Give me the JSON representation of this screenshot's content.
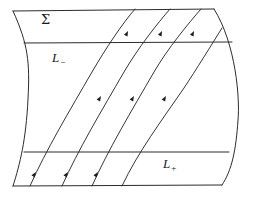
{
  "figure": {
    "kind": "flow-box-diagram",
    "background_color": "#ffffff",
    "stroke_color": "#2b2b2b",
    "label_color": "#1a1a1a"
  },
  "labels": {
    "sigma": {
      "text": "Σ",
      "x": 41,
      "y": 24
    },
    "l_minus": {
      "base": "L",
      "sub": "−",
      "x": 52,
      "y": 62
    },
    "l_plus": {
      "base": "L",
      "sub": "+",
      "x": 163,
      "y": 168
    }
  },
  "boundary": {
    "top_edge": "M 13 11 L 214 9",
    "bottom_edge": "M 13 186 L 222 185",
    "left_edge": "M 13 11 C 28 44 30 62 28 99 C 26 140 20 164 13 186",
    "right_edge": "M 214 9 C 236 44 240 99 238 120 C 236 150 232 170 222 185"
  },
  "exit_lines": {
    "l_minus_line": {
      "name": "L-minus",
      "path": "M 24 43 L 232 42"
    },
    "l_plus_line": {
      "name": "L-plus",
      "path": "M 24 152 L 229 152"
    }
  },
  "flow_curves": [
    {
      "id": "flow-1",
      "path": "M 30 186 C 46 150 70 110 92 72 C 106 48 122 24 135 9"
    },
    {
      "id": "flow-2",
      "path": "M 62 186 C 78 150 102 110 124 72 C 138 48 157 24 170 9"
    },
    {
      "id": "flow-3",
      "path": "M 92 186 C 108 150 132 110 154 72 C 168 48 188 24 201 9"
    },
    {
      "id": "flow-4",
      "path": "M 122 186 C 138 152 162 120 184 88 C 196 70 212 44 222 28"
    }
  ],
  "arrow_heads": [
    {
      "id": "arrow-1-low",
      "x": 36,
      "y": 172,
      "angle": -56
    },
    {
      "id": "arrow-2-low",
      "x": 68,
      "y": 172,
      "angle": -56
    },
    {
      "id": "arrow-3-low",
      "x": 98,
      "y": 172,
      "angle": -56
    },
    {
      "id": "arrow-1-mid",
      "x": 101,
      "y": 96,
      "angle": -60
    },
    {
      "id": "arrow-2-mid",
      "x": 134,
      "y": 96,
      "angle": -60
    },
    {
      "id": "arrow-3-mid",
      "x": 166,
      "y": 96,
      "angle": -60
    },
    {
      "id": "arrow-1-high",
      "x": 128,
      "y": 31,
      "angle": -64
    },
    {
      "id": "arrow-2-high",
      "x": 162,
      "y": 31,
      "angle": -64
    },
    {
      "id": "arrow-3-high",
      "x": 194,
      "y": 31,
      "angle": -64
    }
  ]
}
